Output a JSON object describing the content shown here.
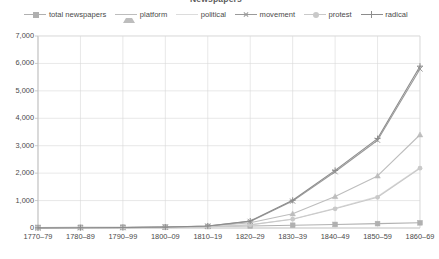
{
  "chart_title": "Newspapers",
  "legend": {
    "position": "top",
    "items": [
      {
        "label": "total newspapers",
        "marker": "square",
        "color": "#b0b0b0"
      },
      {
        "label": "platform",
        "marker": "triangle",
        "color": "#bdbdbd"
      },
      {
        "label": "political",
        "marker": "none",
        "color": "#dcdcdc"
      },
      {
        "label": "movement",
        "marker": "x",
        "color": "#9a9a9a"
      },
      {
        "label": "protest",
        "marker": "dot",
        "color": "#c9c9c9"
      },
      {
        "label": "radical",
        "marker": "plus",
        "color": "#8c8c8c"
      }
    ]
  },
  "axis": {
    "y_ticks": [
      "0",
      "1,000",
      "2,000",
      "3,000",
      "4,000",
      "5,000",
      "6,000",
      "7,000"
    ],
    "x_ticks": [
      "1770–79",
      "1780–89",
      "1790–99",
      "1800–09",
      "1810–19",
      "1820–29",
      "1830–39",
      "1840–49",
      "1850–59",
      "1860–69"
    ]
  },
  "colors": {
    "gridline": "#d9d9d9",
    "axis": "#bfbfbf",
    "text": "#4a4a4a",
    "background": "#ffffff"
  },
  "chart_data": {
    "type": "line",
    "title": "Newspapers",
    "xlabel": "",
    "ylabel": "",
    "ylim": [
      0,
      7000
    ],
    "ystep": 1000,
    "grid": true,
    "legend_position": "top",
    "categories": [
      "1770–79",
      "1780–89",
      "1790–99",
      "1800–09",
      "1810–19",
      "1820–29",
      "1830–39",
      "1840–49",
      "1850–59",
      "1860–69"
    ],
    "series": [
      {
        "name": "total newspapers",
        "color": "#b0b0b0",
        "marker": "square",
        "values": [
          20,
          25,
          30,
          40,
          55,
          75,
          100,
          130,
          160,
          190
        ]
      },
      {
        "name": "platform",
        "color": "#bdbdbd",
        "marker": "triangle",
        "values": [
          5,
          8,
          12,
          25,
          60,
          190,
          520,
          1150,
          1900,
          3400
        ]
      },
      {
        "name": "political",
        "color": "#dcdcdc",
        "marker": "none",
        "values": [
          3,
          5,
          8,
          15,
          40,
          120,
          330,
          720,
          1150,
          2200
        ]
      },
      {
        "name": "movement",
        "color": "#9a9a9a",
        "marker": "x",
        "values": [
          6,
          10,
          15,
          30,
          70,
          240,
          980,
          2050,
          3200,
          5800
        ]
      },
      {
        "name": "protest",
        "color": "#c9c9c9",
        "marker": "dot",
        "values": [
          3,
          5,
          8,
          14,
          38,
          115,
          320,
          700,
          1120,
          2180
        ]
      },
      {
        "name": "radical",
        "color": "#8c8c8c",
        "marker": "plus",
        "values": [
          6,
          10,
          16,
          32,
          75,
          255,
          1010,
          2100,
          3260,
          5900
        ]
      }
    ]
  }
}
